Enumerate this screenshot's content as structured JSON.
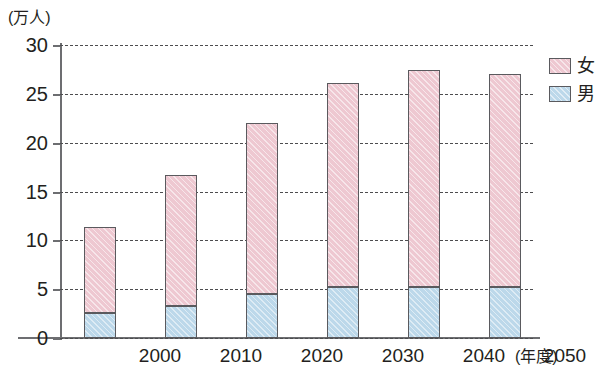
{
  "chart_data": {
    "type": "bar",
    "stacked": true,
    "title": "",
    "subtitle": "",
    "xlabel": "(年度)",
    "ylabel": "(万人)",
    "categories": [
      "2000",
      "2010",
      "2020",
      "2030",
      "2040",
      "2050"
    ],
    "series": [
      {
        "name": "男",
        "color": "#bcd8ea",
        "values": [
          2.6,
          3.3,
          4.5,
          5.2,
          5.2,
          5.2
        ]
      },
      {
        "name": "女",
        "color": "#eec8d1",
        "values": [
          8.8,
          13.4,
          17.5,
          20.9,
          22.2,
          21.8
        ]
      }
    ],
    "totals": [
      11.4,
      16.7,
      22.0,
      26.1,
      27.4,
      27.0
    ],
    "ylim": [
      0,
      30
    ],
    "yticks": [
      0,
      5,
      10,
      15,
      20,
      25,
      30
    ],
    "ytick_labels": [
      "0",
      "5",
      "10",
      "15",
      "20",
      "25",
      "30"
    ],
    "grid": true,
    "grid_style": "dashed-horizontal",
    "legend_position": "right-top",
    "legend_entries": [
      "女",
      "男"
    ]
  },
  "axes": {
    "y_unit_label": "(万人)",
    "x_unit_label": "(年度)"
  }
}
